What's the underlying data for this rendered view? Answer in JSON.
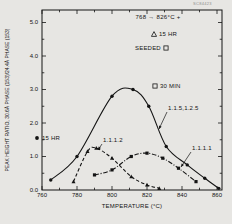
{
  "figure": {
    "corner_id": "SC84423"
  },
  "chart_data": {
    "type": "line",
    "title": "768 → 826°C  +",
    "xlabel": "TEMPERATURE (°C)",
    "ylabel": "PEAK HEIGHT RATIO, 30.6Å PHASE (153)/24.4Å PHASE (153)",
    "xlim": [
      760,
      863
    ],
    "ylim": [
      0,
      5.4
    ],
    "x_ticks": [
      "760",
      "780",
      "800",
      "820",
      "840",
      "860"
    ],
    "y_ticks": [
      "0.0",
      "1.0",
      "2.0",
      "3.0",
      "4.0",
      "5.0"
    ],
    "grid": false,
    "legend_position": "inside top-right and left",
    "background": "#e7e6e3",
    "ink": "#141414",
    "series": [
      {
        "name": "1.1.5,1.2.5",
        "condition": "15 HR",
        "marker": "circle",
        "line_style": "solid",
        "x": [
          765,
          780,
          800,
          812,
          821,
          831,
          843,
          853,
          861
        ],
        "y": [
          0.3,
          1.0,
          2.8,
          3.0,
          2.5,
          1.3,
          0.75,
          0.35,
          0.05
        ]
      },
      {
        "name": "1.1.1.2",
        "marker": "triangle",
        "line_style": "dashed",
        "x": [
          778,
          786,
          791,
          800,
          811,
          820,
          827
        ],
        "y": [
          0.25,
          1.15,
          1.25,
          0.95,
          0.4,
          0.15,
          0.05
        ]
      },
      {
        "name": "1.1.1.1",
        "marker": "square",
        "line_style": "dashdot",
        "x": [
          790,
          800,
          811,
          820,
          829,
          838,
          848
        ],
        "y": [
          0.45,
          0.6,
          1.0,
          1.1,
          0.95,
          0.65,
          0.25
        ]
      }
    ],
    "annotations": [
      {
        "text": "15 HR",
        "marker": "triangle-open",
        "marker_pos": "left"
      },
      {
        "text": "SEEDED",
        "marker": "square-open",
        "marker_pos": "right"
      },
      {
        "text": "30 MIN",
        "marker": "square-open",
        "marker_pos": "left"
      },
      {
        "text": "15 HR",
        "marker": "circle-filled",
        "marker_pos": "left"
      }
    ],
    "series_labels": [
      {
        "text": "1.1.5,1.2.5",
        "label_px": [
          167,
          112
        ],
        "target_px": [
          159,
          129
        ]
      },
      {
        "text": "1.1.1.2",
        "label_px": [
          102,
          144
        ],
        "target_px": [
          98,
          150
        ]
      },
      {
        "text": "1.1.1.1",
        "label_px": [
          191,
          152
        ],
        "target_px": [
          181,
          167
        ]
      }
    ],
    "layout": {
      "left": 42,
      "right": 222,
      "top": 10,
      "bottom": 190,
      "x_min": 760,
      "px_per_x": 1.75,
      "px_per_y": 33.5,
      "x_minor": [
        770,
        790,
        810,
        830,
        850
      ],
      "y_minor": [
        0.5,
        1.5,
        2.5,
        3.5,
        4.5
      ]
    }
  }
}
